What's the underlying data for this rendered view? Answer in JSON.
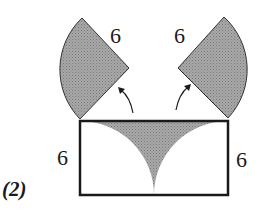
{
  "figure": {
    "label": "(2)",
    "fill_color": "#9a9a9a",
    "stroke_color": "#1a1a1a"
  },
  "labels": {
    "left_sector_radius": "6",
    "right_sector_radius": "6",
    "rect_left_height": "6",
    "rect_right_height": "6"
  },
  "shapes": {
    "left_sector": "quarter circle sector, radius 6, rotated off rectangle top-left corner",
    "right_sector": "quarter circle sector, radius 6, rotated off rectangle top-right corner",
    "rectangle": "rectangle with height 6 and width 12",
    "shaded_region": "region between the two quarter arcs inside the rectangle"
  },
  "arrows": [
    "left arrow pointing to left sector",
    "right arrow pointing to right sector"
  ]
}
